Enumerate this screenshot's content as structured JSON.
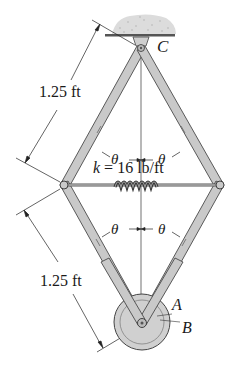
{
  "diagram": {
    "type": "mechanism",
    "points": {
      "top_pin": "C",
      "bottom_pin": "A",
      "wheel": "B"
    },
    "dimensions": {
      "upper_length": "1.25 ft",
      "lower_length": "1.25 ft"
    },
    "angles": {
      "upper_left": "θ",
      "upper_right": "θ",
      "lower_left": "θ",
      "lower_right": "θ"
    },
    "spring": {
      "label": "k = 16 lb/ft"
    },
    "colors": {
      "bar_fill": "#c9c9c9",
      "bar_edge": "#4a4a4a",
      "line": "#222222",
      "ground": "#d8d8d8",
      "wheel": "#cfcfcf"
    }
  }
}
